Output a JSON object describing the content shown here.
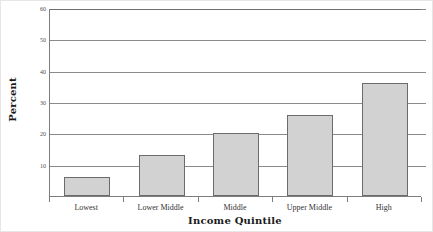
{
  "chart_data": {
    "type": "bar",
    "title": "",
    "categories": [
      "Lowest",
      "Lower Middle",
      "Middle",
      "Upper Middle",
      "High"
    ],
    "values": [
      6,
      13,
      20,
      26,
      36
    ],
    "xlabel": "Income Quintile",
    "ylabel": "Percent",
    "ylim": [
      0,
      60
    ],
    "ytick_labels": [
      "60",
      "50",
      "40",
      "30",
      "20",
      "10"
    ],
    "ytick_values": [
      60,
      50,
      40,
      30,
      20,
      10
    ],
    "ytick_step": 10,
    "grid": "horizontal",
    "legend": "none",
    "bar_fill_color": "#d2d2d2",
    "bar_border_color": "#6b6b6b",
    "gridline_color": "#8a8a8a",
    "axis_color": "#7d7d7d",
    "background_color": "#ffffff",
    "text_color": "#333333"
  }
}
